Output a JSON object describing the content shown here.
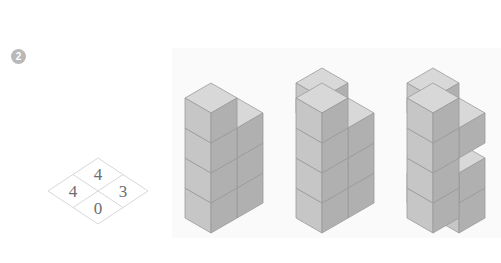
{
  "page": {
    "background_color": "#ffffff",
    "width": 501,
    "height": 263
  },
  "question": {
    "number_label": "2",
    "badge_color": "#b9b9b9",
    "badge_text_color": "#ffffff"
  },
  "plan_grid": {
    "name": "isometric-plan-grid",
    "description": "2x2 isometric diamond grid showing cube counts per column",
    "line_color": "#d2d2d2",
    "text_color": "#6d6d6d",
    "cells": [
      {
        "position": "top",
        "value": "4"
      },
      {
        "position": "left",
        "value": "4"
      },
      {
        "position": "right",
        "value": "3"
      },
      {
        "position": "bottom",
        "value": "0"
      }
    ]
  },
  "panel": {
    "name": "figures-panel",
    "background_color": "#fafafa"
  },
  "colors": {
    "cube_top": "#d8d8d8",
    "cube_left": "#c6c6c6",
    "cube_right": "#b0b0b0",
    "cube_edge": "#9a9a9a",
    "cube_top_alt": "#e2e2e2"
  },
  "figures": [
    {
      "label": "figure-a",
      "description": "Two columns of cubes: tall left column, shorter right column",
      "column_heights": [
        4,
        3
      ]
    },
    {
      "label": "figure-b",
      "description": "Two columns with an extra back cube at top of left column",
      "column_heights": [
        4,
        3
      ]
    },
    {
      "label": "figure-c",
      "description": "Two columns with a recessed notch near the base of the right column",
      "column_heights": [
        4,
        4
      ]
    }
  ]
}
